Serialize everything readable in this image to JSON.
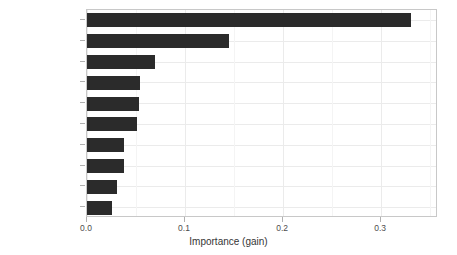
{
  "chart_data": {
    "type": "bar",
    "orientation": "horizontal",
    "title": "",
    "xlabel": "Importance (gain)",
    "ylabel": "",
    "categories": [
      "Overall_Qual",
      "Gr_Liv_Area",
      "Total_Bsmt_SF",
      "Year_Built",
      "Garage_Cars",
      "First_Flr_SF",
      "Exter_Qual",
      "Bsmt_Qual",
      "Second_Flr_SF",
      "Garage_Area"
    ],
    "values": [
      0.33,
      0.145,
      0.069,
      0.054,
      0.053,
      0.051,
      0.038,
      0.038,
      0.031,
      0.025
    ],
    "xlim": [
      0.0,
      0.358
    ],
    "xticks": [
      0.0,
      0.1,
      0.2,
      0.3
    ],
    "xtick_labels": [
      "0.0",
      "0.1",
      "0.2",
      "0.3"
    ],
    "xminor_ticks": [
      0.05,
      0.15,
      0.25,
      0.35
    ],
    "grid": true,
    "legend": null,
    "bar_color": "#2b2b2b",
    "panel_background": "#ffffff",
    "gridline_color": "#ebebeb",
    "panel_border_color": "#c8c8c8",
    "axis_text_color": "#4d4d4d"
  }
}
